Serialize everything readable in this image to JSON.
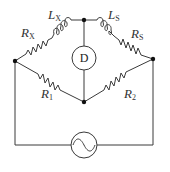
{
  "diagram": {
    "type": "AC bridge circuit (Maxwell inductance bridge)",
    "components": {
      "rx": {
        "symbol": "R",
        "subscript": "X",
        "kind": "resistor"
      },
      "lx": {
        "symbol": "L",
        "subscript": "X",
        "kind": "inductor"
      },
      "ls": {
        "symbol": "L",
        "subscript": "S",
        "kind": "inductor"
      },
      "rs": {
        "symbol": "R",
        "subscript": "S",
        "kind": "resistor"
      },
      "r1": {
        "symbol": "R",
        "subscript": "1",
        "kind": "resistor"
      },
      "r2": {
        "symbol": "R",
        "subscript": "2",
        "kind": "resistor"
      },
      "detector": {
        "label": "D",
        "kind": "detector"
      },
      "source": {
        "kind": "ac-source",
        "glyph": "~"
      }
    },
    "nodes": [
      "top",
      "left",
      "right",
      "bottom"
    ],
    "colors": {
      "wire": "#3a3a3a",
      "node": "#111111",
      "text": "#333333"
    }
  }
}
